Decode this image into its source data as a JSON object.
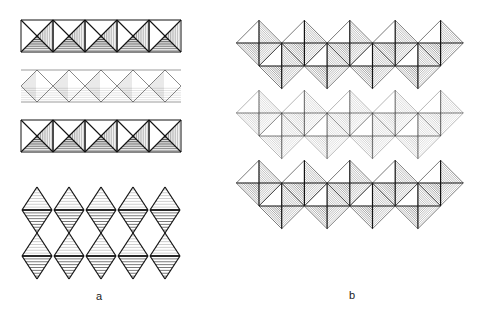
{
  "figure": {
    "panel_a": {
      "label": "a",
      "square_rows": [
        {
          "y": 20,
          "style": "dark",
          "count": 5
        },
        {
          "y": 70,
          "style": "light",
          "count": 5
        },
        {
          "y": 120,
          "style": "dark",
          "count": 5
        }
      ],
      "octahedra_rows": [
        {
          "cy": 210,
          "count": 5
        },
        {
          "cy": 256,
          "count": 5
        }
      ]
    },
    "panel_b": {
      "label": "b",
      "chains": [
        {
          "y": 20,
          "style": "dark"
        },
        {
          "y": 90,
          "style": "light"
        },
        {
          "y": 160,
          "style": "dark"
        }
      ]
    },
    "colors": {
      "line": "#111111",
      "background": "#ffffff"
    }
  }
}
